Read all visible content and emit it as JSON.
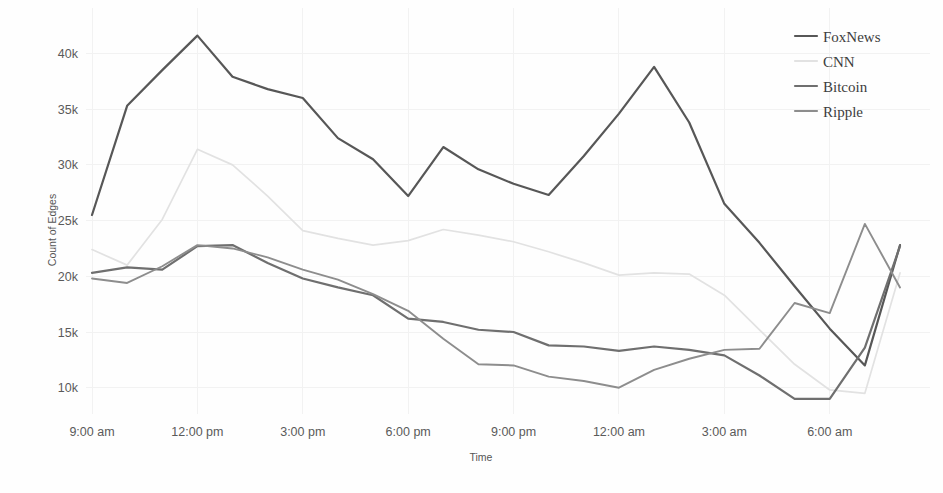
{
  "chart_data": {
    "type": "line",
    "title": "",
    "xlabel": "Time",
    "ylabel": "Count of Edges",
    "grid": true,
    "legend_position": "top-right",
    "xlim": [
      0,
      23
    ],
    "ylim": [
      8000,
      43000
    ],
    "ytick_values": [
      10000,
      15000,
      20000,
      25000,
      30000,
      35000,
      40000
    ],
    "ytick_labels": [
      "10k",
      "15k",
      "20k",
      "25k",
      "30k",
      "35k",
      "40k"
    ],
    "xtick_values": [
      0,
      3,
      6,
      9,
      12,
      15,
      18,
      21
    ],
    "xtick_labels": [
      "9:00 am",
      "12:00 pm",
      "3:00 pm",
      "6:00 pm",
      "9:00 pm",
      "12:00 am",
      "3:00 am",
      "6:00 am"
    ],
    "x": [
      0,
      1,
      2,
      3,
      4,
      5,
      6,
      7,
      8,
      9,
      10,
      11,
      12,
      13,
      14,
      15,
      16,
      17,
      18,
      19,
      20,
      21,
      22,
      23
    ],
    "series": [
      {
        "name": "FoxNews",
        "color": "#575757",
        "width": 2.2,
        "values": [
          25500,
          35300,
          38500,
          41600,
          37900,
          36800,
          36000,
          32400,
          30500,
          27200,
          31600,
          29600,
          28300,
          27300,
          30800,
          34600,
          38800,
          33800,
          26500,
          23000,
          19100,
          15300,
          12000,
          22800
        ]
      },
      {
        "name": "CNN",
        "color": "#e2e2e2",
        "width": 1.7,
        "values": [
          22400,
          21000,
          25100,
          31400,
          30000,
          27200,
          24100,
          23400,
          22800,
          23200,
          24200,
          23700,
          23100,
          22200,
          21200,
          20100,
          20300,
          20200,
          18300,
          15200,
          12100,
          9800,
          9500,
          20300
        ]
      },
      {
        "name": "Bitcoin",
        "color": "#6f6f6f",
        "width": 2.2,
        "values": [
          20300,
          20800,
          20600,
          22700,
          22800,
          21200,
          19800,
          19000,
          18300,
          16200,
          15900,
          15200,
          15000,
          13800,
          13700,
          13300,
          13700,
          13400,
          12900,
          11100,
          9000,
          9000,
          13600,
          22700
        ]
      },
      {
        "name": "Ripple",
        "color": "#8d8d8d",
        "width": 1.9,
        "values": [
          19800,
          19400,
          20900,
          22800,
          22500,
          21700,
          20600,
          19700,
          18400,
          16900,
          14400,
          12100,
          12000,
          11000,
          10600,
          10000,
          11600,
          12600,
          13400,
          13500,
          17600,
          16700,
          24700,
          19000
        ]
      }
    ]
  },
  "legend": {
    "items": [
      {
        "label": "FoxNews",
        "color": "#575757"
      },
      {
        "label": "CNN",
        "color": "#e2e2e2"
      },
      {
        "label": "Bitcoin",
        "color": "#6f6f6f"
      },
      {
        "label": "Ripple",
        "color": "#8d8d8d"
      }
    ]
  },
  "axes": {
    "y_title": "Count of Edges",
    "x_title": "Time"
  }
}
